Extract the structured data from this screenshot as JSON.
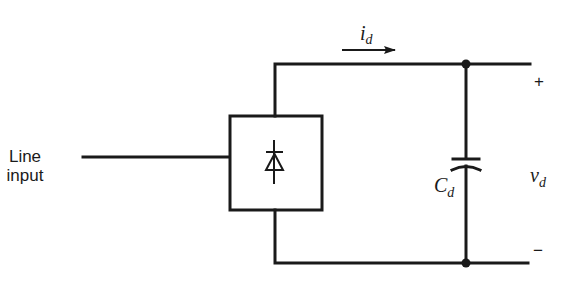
{
  "diagram": {
    "type": "circuit-schematic",
    "title": "",
    "input_label": {
      "line1": "Line",
      "line2": "input"
    },
    "rectifier_block": {
      "symbol": "diode-icon"
    },
    "current_label": {
      "symbol": "i",
      "subscript": "d"
    },
    "capacitor_label": {
      "symbol": "C",
      "subscript": "d"
    },
    "voltage_label": {
      "symbol": "v",
      "subscript": "d"
    },
    "plus_terminal": "+",
    "minus_terminal": "−",
    "colors": {
      "line": "#1a1a1a",
      "background": "#ffffff"
    }
  }
}
